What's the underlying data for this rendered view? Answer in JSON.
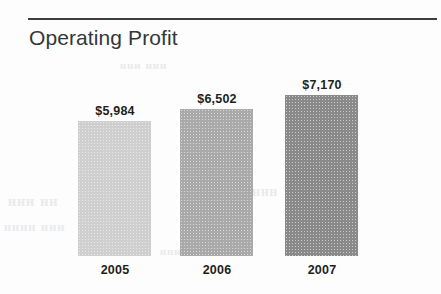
{
  "rule": {
    "name": "horizontal-rule",
    "color": "#3f3f3f"
  },
  "ghost_text": {
    "a": "ᴴᴴᴴ ᴴᴴ",
    "b": "ᴴᴴᴴᴴ ᴴᴴᴴ",
    "c": "ᴴᴴᴴᴴᴴ ᴴᴴᴴᴴ",
    "d": "ᴴᴴᴴ ᴴᴴᴴᴴᴴ",
    "e": "ᴴᴴᴴᴴ ᴴᴴ",
    "f": "ᴴᴴᴴ ᴴᴴᴴ"
  },
  "chart_data": {
    "type": "bar",
    "title": "Operating Profit",
    "xlabel": "",
    "ylabel": "",
    "categories": [
      "2005",
      "2006",
      "2007"
    ],
    "values": [
      5984,
      6502,
      7170
    ],
    "value_labels": [
      "$5,984",
      "$6,502",
      "$7,170"
    ],
    "value_prefix": "$",
    "grid": false,
    "legend": false,
    "axis_visible": false,
    "bar_colors": [
      "#cfcfcf",
      "#a9a9a9",
      "#8a8a8a"
    ],
    "bars": [
      {
        "category": "2005",
        "value": 5984,
        "label": "$5,984",
        "color": "#cfcfcf",
        "left_px": 65,
        "height_px": 135
      },
      {
        "category": "2006",
        "value": 6502,
        "label": "$6,502",
        "color": "#a9a9a9",
        "left_px": 167,
        "height_px": 147
      },
      {
        "category": "2007",
        "value": 7170,
        "label": "$7,170",
        "color": "#8a8a8a",
        "left_px": 272,
        "height_px": 161
      }
    ]
  }
}
